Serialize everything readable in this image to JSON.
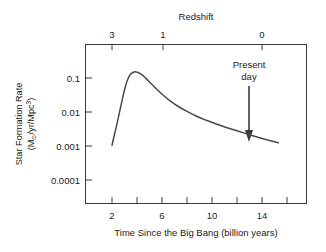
{
  "chart_data": {
    "type": "line",
    "title": "",
    "xlabel": "Time Since the Big Bang (billion years)",
    "ylabel_line1": "Star Formation Rate",
    "ylabel_line2_prefix": "(M",
    "ylabel_line2_sun": "⊙",
    "ylabel_line2_mid": "/yr/Mpc",
    "ylabel_line2_exp": "3",
    "ylabel_line2_suffix": ")",
    "ylabel_plain": "Star Formation Rate (M⊙/yr/Mpc³)",
    "top_axis_title": "Redshift",
    "yscale": "log",
    "ylim": [
      5e-05,
      0.35
    ],
    "xlim": [
      1.2,
      16.6
    ],
    "grid": false,
    "legend": null,
    "y_tick_values": [
      0.1,
      0.01,
      0.001,
      0.0001
    ],
    "y_tick_labels": [
      "0.1",
      "0.01",
      "0.001",
      "0.0001"
    ],
    "x_tick_values": [
      2,
      4,
      6,
      8,
      10,
      12,
      14,
      16
    ],
    "x_tick_labels": [
      "2",
      "",
      "6",
      "",
      "10",
      "",
      "14",
      ""
    ],
    "x_major_labeled": [
      {
        "value": 2,
        "label": "2"
      },
      {
        "value": 6,
        "label": "6"
      },
      {
        "value": 10,
        "label": "10"
      },
      {
        "value": 14,
        "label": "14"
      }
    ],
    "top_tick_values": [
      3,
      1,
      0
    ],
    "top_tick_labels": [
      "3",
      "1",
      "0"
    ],
    "top_tick_x_px": [
      112,
      163,
      262
    ],
    "annotations": [
      {
        "name": "present-day",
        "label_line1": "Present",
        "label_line2": "day",
        "x_value": 14,
        "arrow": "down"
      }
    ],
    "series": [
      {
        "name": "Cosmic star formation rate density",
        "color": "#4a4a4a",
        "x": [
          2.0,
          2.2,
          2.45,
          2.7,
          2.95,
          3.2,
          3.45,
          3.7,
          3.95,
          4.3,
          4.7,
          5.1,
          5.6,
          6.1,
          6.7,
          7.3,
          8.0,
          8.8,
          9.6,
          10.4,
          11.2,
          12.0,
          12.9,
          13.8,
          14.6,
          15.3
        ],
        "y": [
          0.00105,
          0.0022,
          0.0055,
          0.0145,
          0.037,
          0.08,
          0.125,
          0.148,
          0.15,
          0.132,
          0.099,
          0.07,
          0.046,
          0.031,
          0.0205,
          0.0145,
          0.0104,
          0.0074,
          0.0056,
          0.00435,
          0.00345,
          0.0028,
          0.0022,
          0.00175,
          0.00145,
          0.00125
        ]
      }
    ],
    "curve_description": "Star formation rate rises steeply from 0.001 at 2 billion years, peaks near 0.15 at about 3.9 billion years, then declines steadily to roughly 0.0012 by 15 billion years."
  },
  "colors": {
    "curve": "#4a4a4a",
    "axis": "#3a3a3a",
    "text": "#1a1a1a",
    "background": "#ffffff"
  }
}
